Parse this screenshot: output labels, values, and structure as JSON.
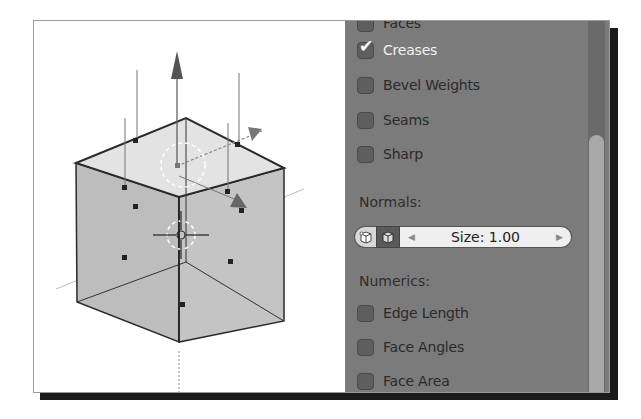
{
  "panel": {
    "overlay_items": [
      {
        "label": "Faces",
        "checked": false
      },
      {
        "label": "Creases",
        "checked": true
      },
      {
        "label": "Bevel Weights",
        "checked": false
      },
      {
        "label": "Seams",
        "checked": false
      },
      {
        "label": "Sharp",
        "checked": false
      }
    ],
    "normals": {
      "section_label": "Normals:",
      "vertex_normals_icon": "vertex-normals-icon",
      "face_normals_icon": "face-normals-icon",
      "size_label": "Size: 1.00",
      "size_value": 1.0,
      "decrement_glyph": "◀",
      "increment_glyph": "▶"
    },
    "numerics": {
      "section_label": "Numerics:",
      "items": [
        {
          "label": "Edge Length",
          "checked": false
        },
        {
          "label": "Face Angles",
          "checked": false
        },
        {
          "label": "Face Area",
          "checked": false
        }
      ]
    },
    "check_glyph": "✔",
    "scrollbar_position": 0.35
  },
  "viewport": {
    "object": "cube",
    "mode": "edit",
    "show_face_normals": true,
    "manipulator_icon": "transform-manipulator-icon",
    "cursor_icon": "3d-cursor-icon"
  }
}
